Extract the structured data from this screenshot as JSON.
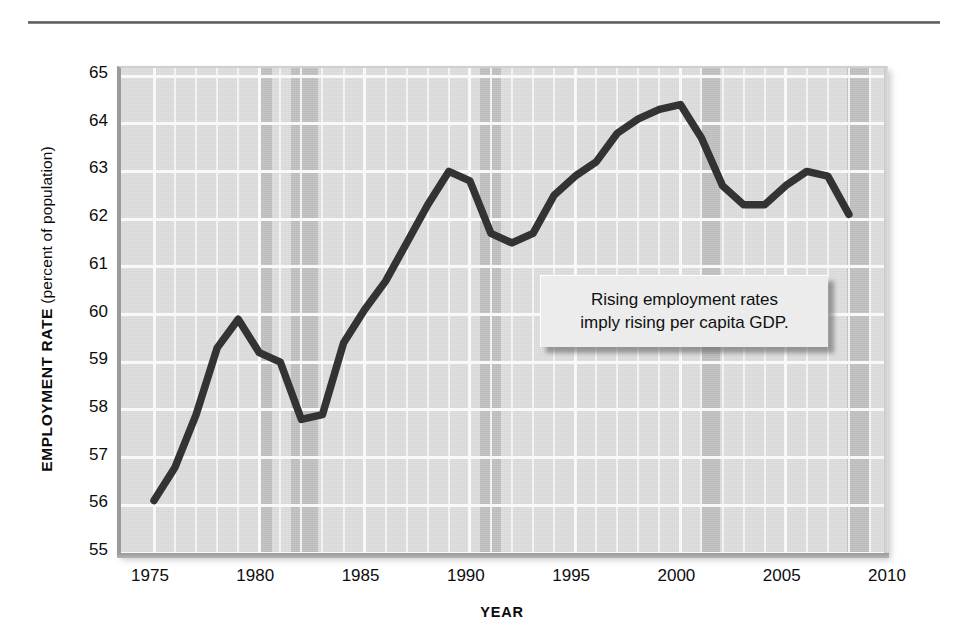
{
  "figure": {
    "y_axis_title_bold": "EMPLOYMENT RATE",
    "y_axis_title_paren": " (percent of population)",
    "x_axis_title": "YEAR",
    "annotation_line1": "Rising employment rates",
    "annotation_line2": "imply rising per capita GDP.",
    "colors": {
      "plot_background": "#dcdcdc",
      "gridline": "#fbfbfb",
      "recession_band": "#bebebe",
      "series_line": "#333333",
      "callout_background": "#ececec",
      "text": "#0d0d0d"
    }
  },
  "chart_data": {
    "type": "line",
    "title": "",
    "xlabel": "YEAR",
    "ylabel": "EMPLOYMENT RATE (percent of population)",
    "xlim": [
      1975,
      2010
    ],
    "ylim": [
      55,
      65
    ],
    "grid": true,
    "legend": "none",
    "xticks": [
      "1975",
      "1980",
      "1985",
      "1990",
      "1995",
      "2000",
      "2005",
      "2010"
    ],
    "yticks": [
      "55",
      "56",
      "57",
      "58",
      "59",
      "60",
      "61",
      "62",
      "63",
      "64",
      "65"
    ],
    "x": [
      1975,
      1976,
      1977,
      1978,
      1979,
      1980,
      1981,
      1982,
      1983,
      1984,
      1985,
      1986,
      1987,
      1988,
      1989,
      1990,
      1991,
      1992,
      1993,
      1994,
      1995,
      1996,
      1997,
      1998,
      1999,
      2000,
      2001,
      2002,
      2003,
      2004,
      2005,
      2006,
      2007,
      2008
    ],
    "values": [
      56.1,
      56.8,
      57.9,
      59.3,
      59.9,
      59.2,
      59.0,
      57.8,
      57.9,
      59.4,
      60.1,
      60.7,
      61.5,
      62.3,
      63.0,
      62.8,
      61.7,
      61.5,
      61.7,
      62.5,
      62.9,
      63.2,
      63.8,
      64.1,
      64.3,
      64.4,
      63.7,
      62.7,
      62.3,
      62.3,
      62.7,
      63.0,
      62.9,
      62.1
    ],
    "annotations": [
      {
        "text": "Rising employment rates imply rising per capita GDP.",
        "type": "callout-box"
      }
    ],
    "shaded_regions": [
      {
        "label": "recession",
        "start": 1980.0,
        "end": 1980.6
      },
      {
        "label": "recession",
        "start": 1981.5,
        "end": 1982.8
      },
      {
        "label": "recession",
        "start": 1990.5,
        "end": 1991.5
      },
      {
        "label": "recession",
        "start": 2001.0,
        "end": 2001.9
      },
      {
        "label": "recession",
        "start": 2007.9,
        "end": 2009.0
      }
    ]
  }
}
